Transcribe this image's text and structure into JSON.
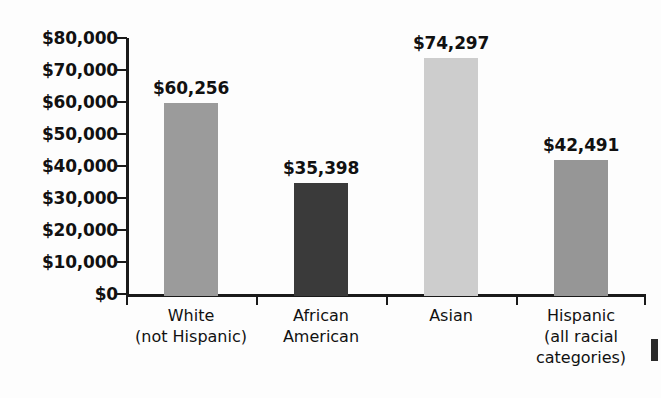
{
  "chart_data": {
    "type": "bar",
    "title": "",
    "subtitle": "",
    "xlabel": "",
    "ylabel": "",
    "ylim": [
      0,
      80000
    ],
    "grid": false,
    "legend": "none",
    "categories": [
      "White\n(not Hispanic)",
      "African\nAmerican",
      "Asian",
      "Hispanic\n(all racial\ncategories)"
    ],
    "category_lines": [
      [
        "White",
        "(not Hispanic)"
      ],
      [
        "African",
        "American"
      ],
      [
        "Asian"
      ],
      [
        "Hispanic",
        "(all racial",
        "categories)"
      ]
    ],
    "values": [
      60256,
      35398,
      74297,
      42491
    ],
    "value_labels": [
      "$60,256",
      "$35,398",
      "$74,297",
      "$42,491"
    ],
    "bar_colors": [
      "#9b9b9b",
      "#3a3a3a",
      "#cdcdcd",
      "#969696"
    ],
    "y_ticks": [
      0,
      10000,
      20000,
      30000,
      40000,
      50000,
      60000,
      70000,
      80000
    ],
    "y_tick_labels": [
      "$0",
      "$10,000",
      "$20,000",
      "$30,000",
      "$40,000",
      "$50,000",
      "$60,000",
      "$70,000",
      "$80,000"
    ],
    "axis_color": "#1a1a1a",
    "text_color": "#111111",
    "background_color": "#fdfdfd"
  }
}
